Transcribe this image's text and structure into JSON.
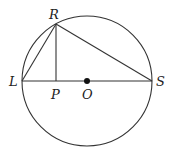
{
  "diagram": {
    "type": "circle-geometry",
    "colors": {
      "stroke": "#333333",
      "text": "#222222",
      "background": "#ffffff"
    },
    "circle": {
      "center": "O",
      "cx": 87,
      "cy": 81,
      "r": 65
    },
    "points": {
      "R": {
        "label": "R",
        "x": 56,
        "y": 24
      },
      "L": {
        "label": "L",
        "x": 22,
        "y": 81
      },
      "P": {
        "label": "P",
        "x": 56,
        "y": 81
      },
      "O": {
        "label": "O",
        "x": 87,
        "y": 81
      },
      "S": {
        "label": "S",
        "x": 152,
        "y": 81
      }
    },
    "segments": [
      [
        "L",
        "S"
      ],
      [
        "L",
        "R"
      ],
      [
        "R",
        "S"
      ],
      [
        "R",
        "P"
      ]
    ]
  }
}
